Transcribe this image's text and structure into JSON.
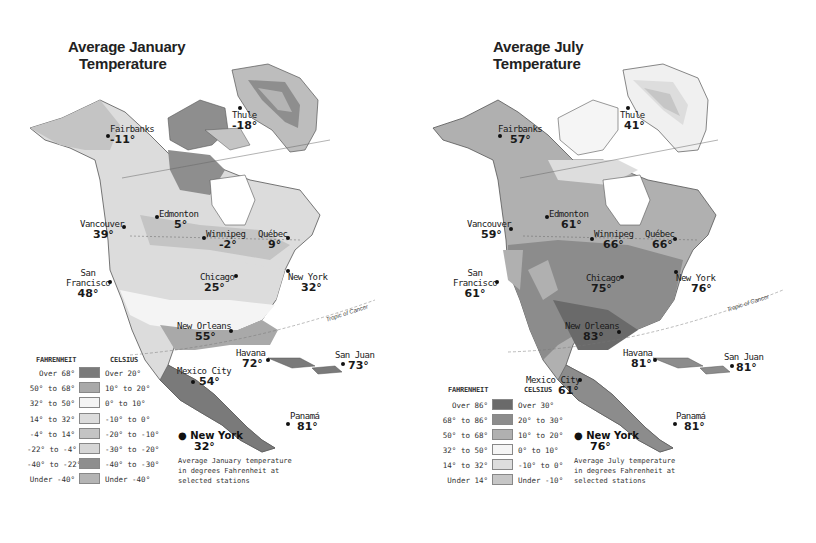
{
  "maps": [
    {
      "id": "january",
      "title_line1": "Average January",
      "title_line2": "Temperature",
      "stations": [
        {
          "name": "Fairbanks",
          "value": "-11°"
        },
        {
          "name": "Thule",
          "value": "-18°"
        },
        {
          "name": "Edmonton",
          "value": "5°"
        },
        {
          "name": "Vancouver",
          "value": "39°"
        },
        {
          "name": "Winnipeg",
          "value": "-2°"
        },
        {
          "name": "Québec",
          "value": "9°"
        },
        {
          "name": "San Francisco",
          "value": "48°"
        },
        {
          "name": "Chicago",
          "value": "25°"
        },
        {
          "name": "New York",
          "value": "32°"
        },
        {
          "name": "New Orleans",
          "value": "55°"
        },
        {
          "name": "Havana",
          "value": "72°"
        },
        {
          "name": "San Juan",
          "value": "73°"
        },
        {
          "name": "Mexico City",
          "value": "54°"
        },
        {
          "name": "Panamá",
          "value": "81°"
        }
      ],
      "legend": {
        "fahrenheit_header": "FAHRENHEIT",
        "celsius_header": "CELSIUS",
        "rows": [
          {
            "f": "Over 68°",
            "c": "Over 20°",
            "color": "#7a7a7a"
          },
          {
            "f": "50° to 68°",
            "c": "10° to 20°",
            "color": "#a9a9a9"
          },
          {
            "f": "32° to 50°",
            "c": "0° to 10°",
            "color": "#f4f4f4"
          },
          {
            "f": "14° to 32°",
            "c": "-10° to 0°",
            "color": "#dcdcdc"
          },
          {
            "f": "-4° to 14°",
            "c": "-20° to -10°",
            "color": "#c4c4c4"
          },
          {
            "f": "-22° to -4°",
            "c": "-30° to -20°",
            "color": "#d6d6d6"
          },
          {
            "f": "-40° to -22°",
            "c": "-40° to -30°",
            "color": "#8e8e8e"
          },
          {
            "f": "Under -40°",
            "c": "Under -40°",
            "color": "#b4b4b4"
          }
        ]
      },
      "key": {
        "sample_station": "New York",
        "sample_value": "32°",
        "description_line1": "Average January temperature",
        "description_line2": "in degrees Fahrenheit at",
        "description_line3": "selected stations"
      },
      "annotations": {
        "tropic": "Tropic of Cancer",
        "arctic": "Arctic Circle"
      }
    },
    {
      "id": "july",
      "title_line1": "Average July",
      "title_line2": "Temperature",
      "stations": [
        {
          "name": "Fairbanks",
          "value": "57°"
        },
        {
          "name": "Thule",
          "value": "41°"
        },
        {
          "name": "Edmonton",
          "value": "61°"
        },
        {
          "name": "Vancouver",
          "value": "59°"
        },
        {
          "name": "Winnipeg",
          "value": "66°"
        },
        {
          "name": "Québec",
          "value": "66°"
        },
        {
          "name": "San Francisco",
          "value": "61°"
        },
        {
          "name": "Chicago",
          "value": "75°"
        },
        {
          "name": "New York",
          "value": "76°"
        },
        {
          "name": "New Orleans",
          "value": "83°"
        },
        {
          "name": "Havana",
          "value": "81°"
        },
        {
          "name": "San Juan",
          "value": "81°"
        },
        {
          "name": "Mexico City",
          "value": "61°"
        },
        {
          "name": "Panamá",
          "value": "81°"
        }
      ],
      "legend": {
        "fahrenheit_header": "FAHRENHEIT",
        "celsius_header": "CELSIUS",
        "rows": [
          {
            "f": "Over 86°",
            "c": "Over 30°",
            "color": "#6a6a6a"
          },
          {
            "f": "68° to 86°",
            "c": "20° to 30°",
            "color": "#8c8c8c"
          },
          {
            "f": "50° to 68°",
            "c": "10° to 20°",
            "color": "#b0b0b0"
          },
          {
            "f": "32° to 50°",
            "c": "0° to 10°",
            "color": "#f5f5f5"
          },
          {
            "f": "14° to 32°",
            "c": "-10° to 0°",
            "color": "#dddddd"
          },
          {
            "f": "Under 14°",
            "c": "Under -10°",
            "color": "#c6c6c6"
          }
        ]
      },
      "key": {
        "sample_station": "New York",
        "sample_value": "76°",
        "description_line1": "Average July temperature",
        "description_line2": "in degrees Fahrenheit at",
        "description_line3": "selected stations"
      },
      "annotations": {
        "tropic": "Tropic of Cancer",
        "arctic": "Arctic Circle"
      }
    }
  ]
}
